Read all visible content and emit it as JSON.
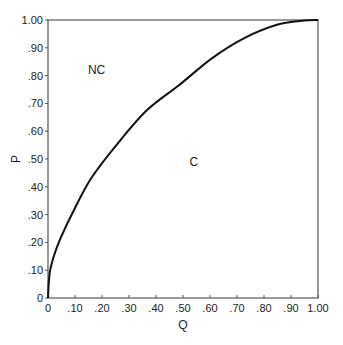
{
  "chart_data": {
    "type": "line",
    "title": "",
    "xlabel": "Q",
    "ylabel": "P",
    "xlim": [
      0,
      1
    ],
    "ylim": [
      0,
      1
    ],
    "grid": false,
    "legend": null,
    "x_ticks": [
      "0",
      ".10",
      ".20",
      ".30",
      ".40",
      ".50",
      ".60",
      ".70",
      ".80",
      ".90",
      "1.00"
    ],
    "y_ticks": [
      "0",
      ".10",
      ".20",
      ".30",
      ".40",
      ".50",
      ".60",
      ".70",
      ".80",
      ".90",
      "1.00"
    ],
    "series": [
      {
        "name": "boundary",
        "x": [
          0,
          0.008,
          0.04,
          0.1,
          0.163,
          0.26,
          0.367,
          0.486,
          0.608,
          0.727,
          0.845,
          0.95,
          1.0
        ],
        "y": [
          0,
          0.1,
          0.2,
          0.324,
          0.435,
          0.558,
          0.676,
          0.766,
          0.863,
          0.935,
          0.982,
          0.998,
          1.0
        ]
      }
    ],
    "annotations": [
      {
        "text": "NC",
        "x": 0.18,
        "y": 0.82
      },
      {
        "text": "C",
        "x": 0.54,
        "y": 0.49
      }
    ],
    "colors": {
      "line": "#111111",
      "axis": "#555555"
    }
  }
}
